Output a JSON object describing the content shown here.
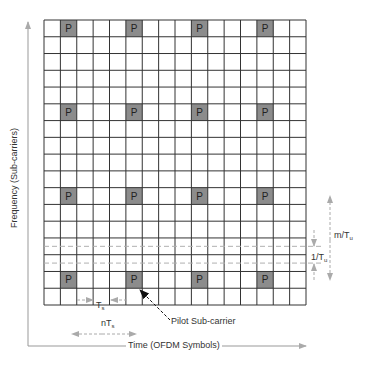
{
  "diagram": {
    "type": "ofdm-pilot-grid",
    "grid": {
      "columns": 16,
      "rows": 17,
      "pilot_columns": [
        1,
        5,
        9,
        13
      ],
      "pilot_rows": [
        0,
        5,
        10,
        15
      ],
      "pilot_symbol": "P",
      "dashed_row_midlines": [
        13,
        14
      ]
    },
    "colors": {
      "grid_line": "#333333",
      "pilot_fill": "#8c8c8c",
      "axis": "#999999",
      "dashed": "#b0b0b0"
    },
    "axes": {
      "y_label": "Frequency (Sub-carriers)",
      "x_label": "Time (OFDM Symbols)"
    },
    "annotations": {
      "pilot_label": "Pilot Sub-carrier",
      "ts": {
        "main": "T",
        "sub": "s"
      },
      "nts": {
        "main": "nT",
        "sub": "s"
      },
      "inv_tu": {
        "main": "1/T",
        "sub": "u"
      },
      "m_tu": {
        "main": "m/T",
        "sub": "u"
      }
    }
  }
}
